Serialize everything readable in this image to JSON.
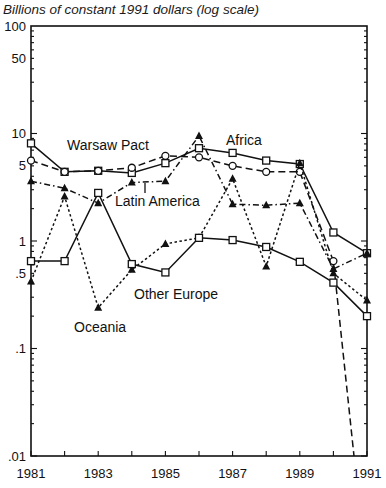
{
  "chart_data": {
    "type": "line",
    "title": "Billions of constant 1991 dollars (log scale)",
    "xlabel": "",
    "ylabel": "Billions of constant 1991 dollars (log scale)",
    "yscale": "log",
    "ylim": [
      0.01,
      100
    ],
    "xlim": [
      1981,
      1991
    ],
    "x": [
      1981,
      1982,
      1983,
      1984,
      1985,
      1986,
      1987,
      1988,
      1989,
      1990,
      1991
    ],
    "x_tick_labels": [
      "1981",
      "1983",
      "1985",
      "1987",
      "1989",
      "1991"
    ],
    "y_tick_labels": [
      {
        "value": 100,
        "label": "100"
      },
      {
        "value": 50,
        "label": "50"
      },
      {
        "value": 10,
        "label": "10"
      },
      {
        "value": 5,
        "label": "5"
      },
      {
        "value": 1,
        "label": "1"
      },
      {
        "value": 0.5,
        "label": ".5"
      },
      {
        "value": 0.1,
        "label": ".1"
      },
      {
        "value": 0.01,
        "label": ".01"
      }
    ],
    "grid": false,
    "legend": "inline labels",
    "series": [
      {
        "name": "Africa",
        "line_style": "solid",
        "marker": "open-square",
        "values": [
          8.1,
          4.4,
          4.5,
          4.3,
          5.3,
          7.3,
          6.6,
          5.6,
          5.2,
          1.2,
          0.77
        ]
      },
      {
        "name": "Warsaw Pact",
        "line_style": "dashed",
        "marker": "open-circle",
        "values": [
          5.6,
          4.4,
          4.5,
          4.8,
          6.2,
          6.0,
          5.0,
          4.4,
          4.4,
          0.65,
          0.01
        ]
      },
      {
        "name": "Latin America",
        "line_style": "dash-dot",
        "marker": "filled-triangle",
        "values": [
          3.6,
          3.1,
          2.25,
          3.5,
          3.6,
          9.5,
          2.2,
          2.15,
          2.25,
          0.55,
          0.77
        ]
      },
      {
        "name": "Oceania",
        "line_style": "dotted",
        "marker": "filled-triangle",
        "values": [
          0.42,
          2.6,
          0.24,
          0.54,
          0.94,
          1.07,
          3.8,
          0.58,
          5.3,
          0.5,
          0.28
        ]
      },
      {
        "name": "Other Europe",
        "line_style": "solid",
        "marker": "open-square",
        "values": [
          0.65,
          0.65,
          2.8,
          0.61,
          0.51,
          1.07,
          1.02,
          0.88,
          0.64,
          0.41,
          0.2
        ]
      }
    ],
    "annotations": [
      {
        "text": "Warsaw Pact",
        "x": 67,
        "y": 150
      },
      {
        "text": "Africa",
        "x": 226,
        "y": 145
      },
      {
        "text": "Latin America",
        "x": 115,
        "y": 206
      },
      {
        "text": "Other Europe",
        "x": 134,
        "y": 299
      },
      {
        "text": "Oceania",
        "x": 74,
        "y": 332
      }
    ]
  }
}
